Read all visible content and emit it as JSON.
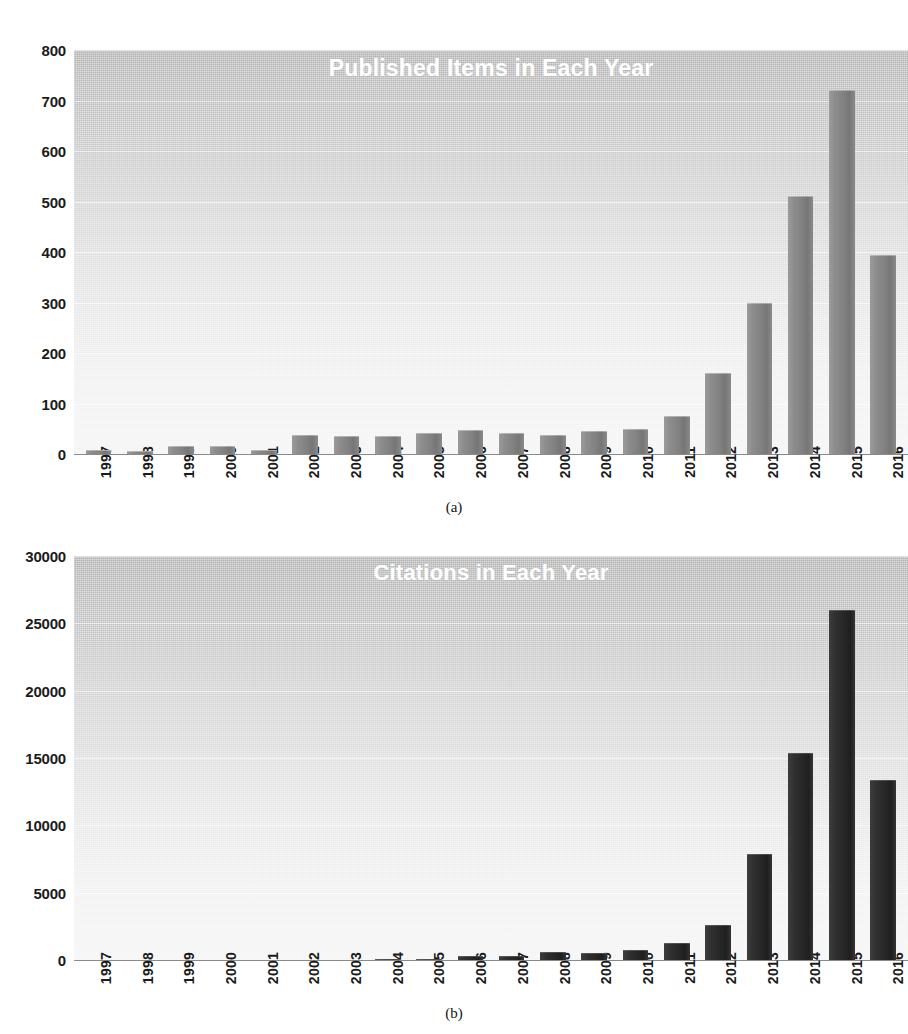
{
  "figure": {
    "subcaption_a": "(a)",
    "subcaption_b": "(b)"
  },
  "chart_data": [
    {
      "type": "bar",
      "title": "Published Items in Each Year",
      "xlabel": "",
      "ylabel": "",
      "ylim": [
        0,
        800
      ],
      "yticks": [
        0,
        100,
        200,
        300,
        400,
        500,
        600,
        700,
        800
      ],
      "ytick_labels": [
        "0",
        "100",
        "200",
        "300",
        "400",
        "500",
        "600",
        "700",
        "800"
      ],
      "grid": true,
      "legend": "none",
      "bar_color": "#7d7d7d",
      "categories": [
        "1997",
        "1998",
        "1999",
        "2000",
        "2001",
        "2002",
        "2003",
        "2004",
        "2005",
        "2006",
        "2007",
        "2008",
        "2009",
        "2010",
        "2011",
        "2012",
        "2013",
        "2014",
        "2015",
        "2016"
      ],
      "values": [
        7,
        6,
        15,
        16,
        8,
        38,
        36,
        35,
        42,
        47,
        42,
        38,
        45,
        50,
        75,
        160,
        300,
        510,
        720,
        395
      ]
    },
    {
      "type": "bar",
      "title": "Citations in Each Year",
      "xlabel": "",
      "ylabel": "",
      "ylim": [
        0,
        30000
      ],
      "yticks": [
        0,
        5000,
        10000,
        15000,
        20000,
        25000,
        30000
      ],
      "ytick_labels": [
        "0",
        "5000",
        "10000",
        "15000",
        "20000",
        "25000",
        "30000"
      ],
      "grid": true,
      "legend": "none",
      "bar_color": "#262626",
      "categories": [
        "1997",
        "1998",
        "1999",
        "2000",
        "2001",
        "2002",
        "2003",
        "2004",
        "2005",
        "2006",
        "2007",
        "2008",
        "2009",
        "2010",
        "2011",
        "2012",
        "2013",
        "2014",
        "2015",
        "2016"
      ],
      "values": [
        0,
        0,
        0,
        0,
        0,
        0,
        0,
        90,
        110,
        300,
        280,
        560,
        540,
        740,
        1300,
        2600,
        7900,
        15400,
        26000,
        13400
      ]
    }
  ]
}
